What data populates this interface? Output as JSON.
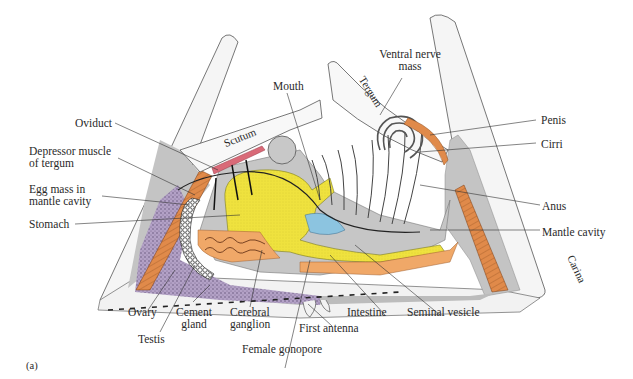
{
  "figure": {
    "panel_label": "(a)",
    "colors": {
      "shell": "#f4f4f4",
      "mantle_gray": "#c4c4c4",
      "yellow_stomach": "#f2e84a",
      "orange_muscle": "#e08a4a",
      "ovary_purple": "#b7a4c8",
      "pink_oviduct": "#d96a78",
      "blue_anus": "#8cc4e0",
      "orange_gland": "#f0a868"
    }
  },
  "plates": {
    "scutum": "Scutum",
    "tergum": "Tergum",
    "carina": "Carina"
  },
  "labels": {
    "mouth": "Mouth",
    "ventral_nerve_mass_1": "Ventral nerve",
    "ventral_nerve_mass_2": "mass",
    "oviduct": "Oviduct",
    "depressor_1": "Depressor muscle",
    "depressor_2": "of tergum",
    "egg_mass_1": "Egg mass in",
    "egg_mass_2": "mantle cavity",
    "stomach": "Stomach",
    "penis": "Penis",
    "cirri": "Cirri",
    "anus": "Anus",
    "mantle_cavity": "Mantle cavity",
    "ovary": "Ovary",
    "testis": "Testis",
    "cement_gland_1": "Cement",
    "cement_gland_2": "gland",
    "cerebral_ganglion_1": "Cerebral",
    "cerebral_ganglion_2": "ganglion",
    "female_gonopore": "Female gonopore",
    "first_antenna": "First antenna",
    "intestine": "Intestine",
    "seminal_vesicle": "Seminal vesicle"
  }
}
